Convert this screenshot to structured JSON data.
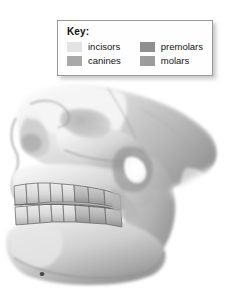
{
  "figure": {
    "background_color": "#ffffff",
    "bone_light": "#f2f2f2",
    "bone_mid": "#cfcfcf",
    "bone_shadow": "#8e8e8e",
    "bone_dark": "#6b6b6b",
    "aperture_highlight": "#ffffff",
    "outline_color": "#777777"
  },
  "legend": {
    "title": "Key:",
    "border_color": "#9a9a9a",
    "background_color": "#fefefe",
    "entries": [
      {
        "label": "incisors",
        "color": "#e3e3e3"
      },
      {
        "label": "premolars",
        "color": "#8f8f8f"
      },
      {
        "label": "canines",
        "color": "#a9a9a9"
      },
      {
        "label": "molars",
        "color": "#9c9c9c"
      }
    ]
  },
  "teeth": {
    "upper_arch_count": 8,
    "lower_arch_count": 8,
    "groups": [
      "incisors",
      "canines",
      "premolars",
      "molars"
    ]
  }
}
